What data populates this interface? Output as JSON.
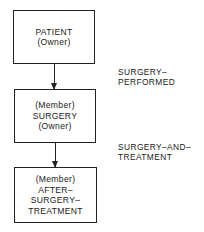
{
  "diagram": {
    "records": [
      {
        "role": "(Owner)",
        "name": "PATIENT",
        "lines": [
          "PATIENT",
          "(Owner)"
        ]
      },
      {
        "role": "(Member) (Owner)",
        "name": "SURGERY",
        "lines": [
          "(Member)",
          "SURGERY",
          "(Owner)"
        ]
      },
      {
        "role": "(Member)",
        "name": "AFTER-SURGERY-TREATMENT",
        "lines": [
          "(Member)",
          "AFTER–",
          "SURGERY–",
          "TREATMENT"
        ]
      }
    ],
    "sets": [
      {
        "name": "SURGERY-PERFORMED",
        "lines": [
          "SURGERY–",
          "PERFORMED"
        ],
        "from": "PATIENT",
        "to": "SURGERY"
      },
      {
        "name": "SURGERY-AND-TREATMENT",
        "lines": [
          "SURGERY–AND–",
          "TREATMENT"
        ],
        "from": "SURGERY",
        "to": "AFTER-SURGERY-TREATMENT"
      }
    ]
  }
}
